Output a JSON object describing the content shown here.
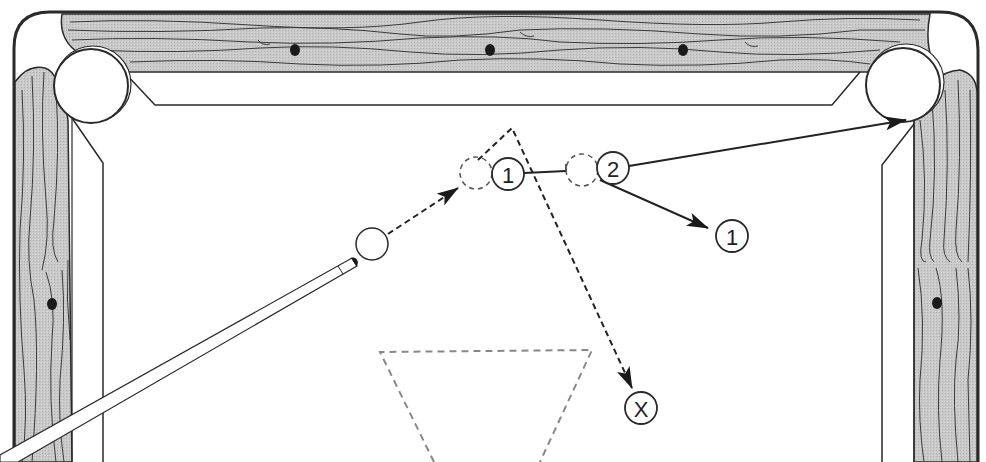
{
  "diagram": {
    "type": "billiards-shot-diagram",
    "colors": {
      "rail_wood": "#c8c8c8",
      "rail_grain": "#3a3a3a",
      "outline": "#2a2a2a",
      "felt": "#ffffff",
      "ghost_dash": "#555555",
      "rack_dash": "#888888",
      "diamond": "#1a1a1a"
    },
    "balls": [
      {
        "id": "cue-ball",
        "label": "",
        "x": 372,
        "y": 244
      },
      {
        "id": "ghost-ball-1",
        "label": "",
        "x": 476,
        "y": 173,
        "ghost": true
      },
      {
        "id": "object-ball-1",
        "label": "1",
        "x": 508,
        "y": 174
      },
      {
        "id": "ghost-ball-2",
        "label": "",
        "x": 582,
        "y": 170,
        "ghost": true
      },
      {
        "id": "object-ball-2",
        "label": "2",
        "x": 613,
        "y": 168
      },
      {
        "id": "ball-1-final-position",
        "label": "1",
        "x": 732,
        "y": 236
      },
      {
        "id": "cue-ball-final-position",
        "label": "X",
        "x": 641,
        "y": 408
      }
    ],
    "labels": {
      "ball_1": "1",
      "ball_2": "2",
      "ball_1_final": "1",
      "cue_final": "X"
    },
    "pockets": [
      {
        "id": "top-left-pocket",
        "x": 90,
        "y": 86
      },
      {
        "id": "top-right-pocket",
        "x": 903,
        "y": 84
      }
    ],
    "diamonds": [
      {
        "rail": "top",
        "x": 295,
        "y": 50
      },
      {
        "rail": "top",
        "x": 490,
        "y": 50
      },
      {
        "rail": "top",
        "x": 683,
        "y": 50
      },
      {
        "rail": "left",
        "x": 52,
        "y": 304
      },
      {
        "rail": "right",
        "x": 937,
        "y": 303
      }
    ]
  }
}
